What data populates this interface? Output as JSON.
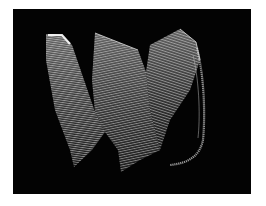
{
  "image": {
    "description": "Light-painting photograph of a white ribbon made of many parallel lines folding in a zig-zag wave over a black background",
    "background_color": "#030303",
    "border_color": "#ffffff",
    "ribbon_color": "#d8d8d8",
    "highlight_color": "#ffffff"
  }
}
